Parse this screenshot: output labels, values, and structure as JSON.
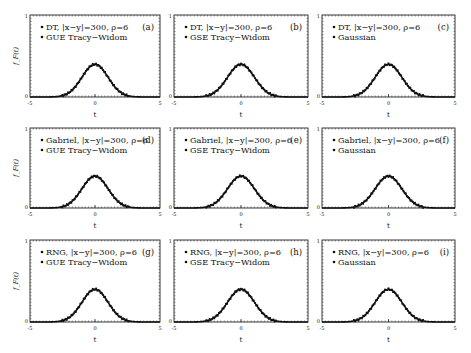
{
  "figure": {
    "ylabel": "f_F(t)",
    "xlabel": "t",
    "xticks": [
      "-5",
      "0",
      "5"
    ],
    "yticks": [
      "0",
      "1"
    ],
    "xlim": [
      -5,
      5
    ],
    "ylim": [
      0,
      1
    ]
  },
  "panels": [
    {
      "id": "a",
      "tag": "(a)",
      "legend": [
        "DT, |x−y|=300, ρ=6",
        "GUE Tracy−Widom"
      ],
      "show_ylabel": true
    },
    {
      "id": "b",
      "tag": "(b)",
      "legend": [
        "DT, |x−y|=300, ρ=6",
        "GSE Tracy−Widom"
      ],
      "show_ylabel": false
    },
    {
      "id": "c",
      "tag": "(c)",
      "legend": [
        "DT, |x−y|=300, ρ=6",
        "Gaussian"
      ],
      "show_ylabel": false
    },
    {
      "id": "d",
      "tag": "(d)",
      "legend": [
        "Gabriel, |x−y|=300, ρ=6",
        "GUE Tracy−Widom"
      ],
      "show_ylabel": true
    },
    {
      "id": "e",
      "tag": "(e)",
      "legend": [
        "Gabriel, |x−y|=300, ρ=6",
        "GSE Tracy−Widom"
      ],
      "show_ylabel": false
    },
    {
      "id": "f",
      "tag": "(f)",
      "legend": [
        "Gabriel, |x−y|=300, ρ=6",
        "Gaussian"
      ],
      "show_ylabel": false
    },
    {
      "id": "g",
      "tag": "(g)",
      "legend": [
        "RNG, |x−y|=300, ρ=6",
        "GUE Tracy−Widom"
      ],
      "show_ylabel": true
    },
    {
      "id": "h",
      "tag": "(h)",
      "legend": [
        "RNG, |x−y|=300, ρ=6",
        "GSE Tracy−Widom"
      ],
      "show_ylabel": false
    },
    {
      "id": "i",
      "tag": "(i)",
      "legend": [
        "RNG, |x−y|=300, ρ=6",
        "Gaussian"
      ],
      "show_ylabel": false
    }
  ],
  "chart_data": [
    {
      "panel": "a",
      "type": "line",
      "title": "(a)",
      "xlabel": "t",
      "ylabel": "f_F(t)",
      "xlim": [
        -5,
        5
      ],
      "ylim": [
        0,
        1
      ],
      "series": [
        {
          "name": "DT, |x-y|=300, rho=6",
          "style": "scatter"
        },
        {
          "name": "GUE Tracy-Widom",
          "style": "line"
        }
      ],
      "x": [
        -5,
        -4,
        -3,
        -2,
        -1.5,
        -1,
        -0.5,
        0,
        0.5,
        1,
        1.5,
        2,
        3,
        4,
        5
      ],
      "y": [
        0.0,
        0.0,
        0.004,
        0.054,
        0.13,
        0.242,
        0.352,
        0.399,
        0.352,
        0.242,
        0.13,
        0.054,
        0.004,
        0.0,
        0.0
      ]
    },
    {
      "panel": "b",
      "type": "line",
      "title": "(b)",
      "xlabel": "t",
      "ylabel": "f_F(t)",
      "xlim": [
        -5,
        5
      ],
      "ylim": [
        0,
        1
      ],
      "series": [
        {
          "name": "DT, |x-y|=300, rho=6",
          "style": "scatter"
        },
        {
          "name": "GSE Tracy-Widom",
          "style": "line"
        }
      ],
      "x": [
        -5,
        -4,
        -3,
        -2,
        -1.5,
        -1,
        -0.5,
        0,
        0.5,
        1,
        1.5,
        2,
        3,
        4,
        5
      ],
      "y": [
        0.0,
        0.0,
        0.004,
        0.054,
        0.13,
        0.242,
        0.352,
        0.399,
        0.352,
        0.242,
        0.13,
        0.054,
        0.004,
        0.0,
        0.0
      ]
    },
    {
      "panel": "c",
      "type": "line",
      "title": "(c)",
      "xlabel": "t",
      "ylabel": "f_F(t)",
      "xlim": [
        -5,
        5
      ],
      "ylim": [
        0,
        1
      ],
      "series": [
        {
          "name": "DT, |x-y|=300, rho=6",
          "style": "scatter"
        },
        {
          "name": "Gaussian",
          "style": "line"
        }
      ],
      "x": [
        -5,
        -4,
        -3,
        -2,
        -1.5,
        -1,
        -0.5,
        0,
        0.5,
        1,
        1.5,
        2,
        3,
        4,
        5
      ],
      "y": [
        0.0,
        0.0,
        0.004,
        0.054,
        0.13,
        0.242,
        0.352,
        0.399,
        0.352,
        0.242,
        0.13,
        0.054,
        0.004,
        0.0,
        0.0
      ]
    },
    {
      "panel": "d",
      "type": "line",
      "title": "(d)",
      "xlabel": "t",
      "ylabel": "f_F(t)",
      "xlim": [
        -5,
        5
      ],
      "ylim": [
        0,
        1
      ],
      "series": [
        {
          "name": "Gabriel, |x-y|=300, rho=6",
          "style": "scatter"
        },
        {
          "name": "GUE Tracy-Widom",
          "style": "line"
        }
      ],
      "x": [
        -5,
        -4,
        -3,
        -2,
        -1.5,
        -1,
        -0.5,
        0,
        0.5,
        1,
        1.5,
        2,
        3,
        4,
        5
      ],
      "y": [
        0.0,
        0.0,
        0.004,
        0.054,
        0.13,
        0.242,
        0.352,
        0.399,
        0.352,
        0.242,
        0.13,
        0.054,
        0.004,
        0.0,
        0.0
      ]
    },
    {
      "panel": "e",
      "type": "line",
      "title": "(e)",
      "xlabel": "t",
      "ylabel": "f_F(t)",
      "xlim": [
        -5,
        5
      ],
      "ylim": [
        0,
        1
      ],
      "series": [
        {
          "name": "Gabriel, |x-y|=300, rho=6",
          "style": "scatter"
        },
        {
          "name": "GSE Tracy-Widom",
          "style": "line"
        }
      ],
      "x": [
        -5,
        -4,
        -3,
        -2,
        -1.5,
        -1,
        -0.5,
        0,
        0.5,
        1,
        1.5,
        2,
        3,
        4,
        5
      ],
      "y": [
        0.0,
        0.0,
        0.004,
        0.054,
        0.13,
        0.242,
        0.352,
        0.399,
        0.352,
        0.242,
        0.13,
        0.054,
        0.004,
        0.0,
        0.0
      ]
    },
    {
      "panel": "f",
      "type": "line",
      "title": "(f)",
      "xlabel": "t",
      "ylabel": "f_F(t)",
      "xlim": [
        -5,
        5
      ],
      "ylim": [
        0,
        1
      ],
      "series": [
        {
          "name": "Gabriel, |x-y|=300, rho=6",
          "style": "scatter"
        },
        {
          "name": "Gaussian",
          "style": "line"
        }
      ],
      "x": [
        -5,
        -4,
        -3,
        -2,
        -1.5,
        -1,
        -0.5,
        0,
        0.5,
        1,
        1.5,
        2,
        3,
        4,
        5
      ],
      "y": [
        0.0,
        0.0,
        0.004,
        0.054,
        0.13,
        0.242,
        0.352,
        0.399,
        0.352,
        0.242,
        0.13,
        0.054,
        0.004,
        0.0,
        0.0
      ]
    },
    {
      "panel": "g",
      "type": "line",
      "title": "(g)",
      "xlabel": "t",
      "ylabel": "f_F(t)",
      "xlim": [
        -5,
        5
      ],
      "ylim": [
        0,
        1
      ],
      "series": [
        {
          "name": "RNG, |x-y|=300, rho=6",
          "style": "scatter"
        },
        {
          "name": "GUE Tracy-Widom",
          "style": "line"
        }
      ],
      "x": [
        -5,
        -4,
        -3,
        -2,
        -1.5,
        -1,
        -0.5,
        0,
        0.5,
        1,
        1.5,
        2,
        3,
        4,
        5
      ],
      "y": [
        0.0,
        0.0,
        0.004,
        0.054,
        0.13,
        0.242,
        0.352,
        0.399,
        0.352,
        0.242,
        0.13,
        0.054,
        0.004,
        0.0,
        0.0
      ]
    },
    {
      "panel": "h",
      "type": "line",
      "title": "(h)",
      "xlabel": "t",
      "ylabel": "f_F(t)",
      "xlim": [
        -5,
        5
      ],
      "ylim": [
        0,
        1
      ],
      "series": [
        {
          "name": "RNG, |x-y|=300, rho=6",
          "style": "scatter"
        },
        {
          "name": "GSE Tracy-Widom",
          "style": "line"
        }
      ],
      "x": [
        -5,
        -4,
        -3,
        -2,
        -1.5,
        -1,
        -0.5,
        0,
        0.5,
        1,
        1.5,
        2,
        3,
        4,
        5
      ],
      "y": [
        0.0,
        0.0,
        0.004,
        0.054,
        0.13,
        0.242,
        0.352,
        0.399,
        0.352,
        0.242,
        0.13,
        0.054,
        0.004,
        0.0,
        0.0
      ]
    },
    {
      "panel": "i",
      "type": "line",
      "title": "(i)",
      "xlabel": "t",
      "ylabel": "f_F(t)",
      "xlim": [
        -5,
        5
      ],
      "ylim": [
        0,
        1
      ],
      "series": [
        {
          "name": "RNG, |x-y|=300, rho=6",
          "style": "scatter"
        },
        {
          "name": "Gaussian",
          "style": "line"
        }
      ],
      "x": [
        -5,
        -4,
        -3,
        -2,
        -1.5,
        -1,
        -0.5,
        0,
        0.5,
        1,
        1.5,
        2,
        3,
        4,
        5
      ],
      "y": [
        0.0,
        0.0,
        0.004,
        0.054,
        0.13,
        0.242,
        0.352,
        0.399,
        0.352,
        0.242,
        0.13,
        0.054,
        0.004,
        0.0,
        0.0
      ]
    }
  ]
}
